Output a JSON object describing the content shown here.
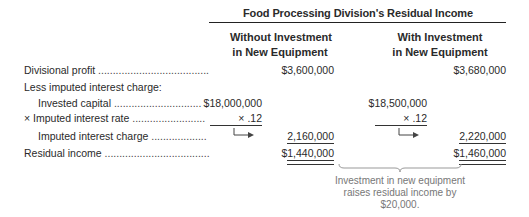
{
  "title": "Food Processing Division's Residual Income",
  "columns": [
    {
      "line1": "Without Investment",
      "line2": "in New Equipment"
    },
    {
      "line1": "With Investment",
      "line2": "in New Equipment"
    }
  ],
  "rows": {
    "divisional_profit": {
      "label": "Divisional profit",
      "dots": " ......................................",
      "without": "$3,600,000",
      "with": "$3,680,000"
    },
    "less_imputed": {
      "label": "Less imputed interest charge:"
    },
    "invested_capital": {
      "label": "Invested capital",
      "dots": " ..............................",
      "without": "$18,000,000",
      "with": "$18,500,000"
    },
    "imputed_rate": {
      "label": "× Imputed interest rate",
      "dots": " .........................",
      "without": "× .12",
      "with": "× .12"
    },
    "imputed_charge": {
      "label": "Imputed interest charge",
      "dots": " ...................",
      "without": "2,160,000",
      "with": "2,220,000"
    },
    "residual_income": {
      "label": "Residual income",
      "dots": " ....................................",
      "without": "$1,440,000",
      "with": "$1,460,000"
    }
  },
  "annotation": {
    "text": "Investment in new equipment raises residual income by $20,000."
  },
  "colors": {
    "text": "#2a2a2a",
    "note": "#777777",
    "rule": "#333333"
  }
}
